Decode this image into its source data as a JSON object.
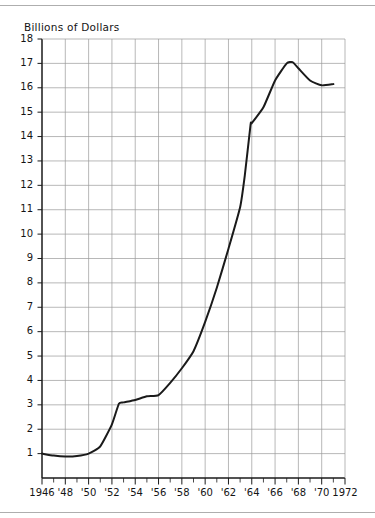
{
  "figure": {
    "name": "line-chart-billions-of-dollars",
    "y_axis_title": "Billions of Dollars",
    "line_color": "#1a1a1a",
    "grid_color": "#9a9a9a",
    "axis_color": "#1a1a1a",
    "background_color": "#ffffff"
  },
  "chart_data": {
    "type": "line",
    "title": "",
    "subtitle": "",
    "xlabel": "",
    "ylabel": "Billions of Dollars",
    "xlim": [
      1946,
      1972
    ],
    "ylim": [
      0,
      18
    ],
    "grid": true,
    "legend": null,
    "x_tick_labels": [
      "1946",
      "'48",
      "'50",
      "'52",
      "'54",
      "'56",
      "'58",
      "'60",
      "'62",
      "'64",
      "'66",
      "'68",
      "'70",
      "1972"
    ],
    "x_tick_values": [
      1946,
      1948,
      1950,
      1952,
      1954,
      1956,
      1958,
      1960,
      1962,
      1964,
      1966,
      1968,
      1970,
      1972
    ],
    "x_minor_tick_interval": 1,
    "y_tick_labels": [
      "1",
      "2",
      "3",
      "4",
      "5",
      "6",
      "7",
      "8",
      "9",
      "10",
      "11",
      "12",
      "13",
      "14",
      "15",
      "16",
      "17",
      "18"
    ],
    "y_tick_values": [
      1,
      2,
      3,
      4,
      5,
      6,
      7,
      8,
      9,
      10,
      11,
      12,
      13,
      14,
      15,
      16,
      17,
      18
    ],
    "y_gridline_values": [
      1,
      2,
      3,
      4,
      5,
      6,
      7,
      8,
      9,
      10,
      11,
      12,
      13,
      14,
      15,
      16,
      17,
      18
    ],
    "x_gridline_values": [
      1948,
      1950,
      1952,
      1954,
      1956,
      1958,
      1960,
      1962,
      1964,
      1966,
      1968,
      1970
    ],
    "series": [
      {
        "name": "Billions of Dollars",
        "x": [
          1946,
          1947,
          1948,
          1949,
          1950,
          1951,
          1952,
          1952.6,
          1953,
          1954,
          1955,
          1956,
          1957,
          1958,
          1959,
          1960,
          1961,
          1962,
          1963,
          1963.4,
          1963.9,
          1964,
          1965,
          1966,
          1967,
          1967.5,
          1968,
          1969,
          1970,
          1971
        ],
        "y": [
          1.0,
          0.92,
          0.88,
          0.9,
          1.0,
          1.3,
          2.2,
          3.05,
          3.1,
          3.2,
          3.35,
          3.4,
          3.9,
          4.5,
          5.2,
          6.4,
          7.8,
          9.4,
          11.1,
          12.4,
          14.5,
          14.55,
          15.2,
          16.3,
          17.0,
          17.05,
          16.8,
          16.3,
          16.1,
          16.15
        ]
      }
    ]
  },
  "axis_geometry": {
    "plot_left_px": 42,
    "plot_right_px": 345,
    "plot_top_px": 39,
    "plot_bottom_px": 478
  }
}
